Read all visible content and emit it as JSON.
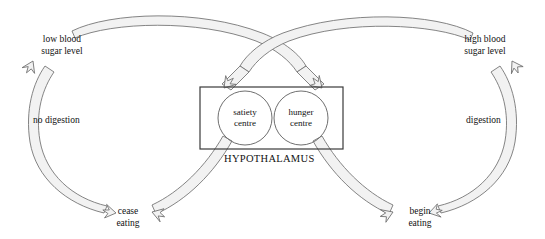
{
  "diagram": {
    "hypothalamus_label": "HYPOTHALAMUS",
    "centres": [
      {
        "id": "satiety",
        "line1": "satiety",
        "line2": "centre"
      },
      {
        "id": "hunger",
        "line1": "hunger",
        "line2": "centre"
      }
    ],
    "states": [
      {
        "id": "low-blood-sugar",
        "line1": "low blood",
        "line2": "sugar level"
      },
      {
        "id": "high-blood-sugar",
        "line1": "high blood",
        "line2": "sugar level"
      }
    ],
    "actions": [
      {
        "id": "cease-eating",
        "line1": "cease",
        "line2": "eating"
      },
      {
        "id": "begin-eating",
        "line1": "begin",
        "line2": "eating"
      }
    ],
    "processes": [
      {
        "id": "no-digestion",
        "label": "no digestion"
      },
      {
        "id": "digestion",
        "label": "digestion"
      }
    ],
    "colors": {
      "stroke": "#6f6f6f",
      "fill": "#f2f2f2",
      "box_stroke": "#3a3a3a",
      "circle_stroke": "#6f6f6f",
      "text": "#111111",
      "background": "#ffffff"
    }
  }
}
